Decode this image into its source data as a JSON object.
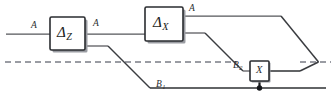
{
  "figure": {
    "type": "quantum-circuit-diagram",
    "width": 333,
    "height": 106,
    "background": "#ffffff",
    "wire_color": "#55565a",
    "dark_wire_color": "#2e3033",
    "dashed_color": "#7a7c85",
    "gate_stroke": "#2a2c30",
    "control_color": "#15171a"
  },
  "gates": [
    {
      "id": "delta-z",
      "symbol": "Δ",
      "subscript": "Z",
      "x": 50,
      "y": 17,
      "w": 35,
      "h": 33
    },
    {
      "id": "delta-x",
      "symbol": "Δ",
      "subscript": "X",
      "x": 145,
      "y": 7,
      "w": 38,
      "h": 34
    },
    {
      "id": "x-gate",
      "symbol": "X",
      "subscript": "",
      "x": 250,
      "y": 61,
      "w": 19,
      "h": 20
    }
  ],
  "wire_labels": [
    {
      "id": "label-a-input",
      "text": "A",
      "sub": "",
      "x": 31,
      "y": 21
    },
    {
      "id": "label-a-mid",
      "text": "A",
      "sub": "",
      "x": 93,
      "y": 19
    },
    {
      "id": "label-a-top",
      "text": "A",
      "sub": "",
      "x": 189,
      "y": 5
    },
    {
      "id": "label-b1",
      "text": "B",
      "sub": "1",
      "x": 156,
      "y": 82
    },
    {
      "id": "label-b2",
      "text": "B",
      "sub": "2",
      "x": 234,
      "y": 63
    }
  ],
  "paths": {
    "input_a": "M 6 34 L 50 34",
    "a_mid": "M 85 34 L 145 34",
    "a_top_out": "M 183 16 L 281 16",
    "a_top_diag": "M 281 16 L 318 62",
    "z_lower_out": "M 85 46 L 108 46",
    "z_lower_diag": "M 108 46 L 150 88",
    "b1_bottom": "M 150 88 L 325 88",
    "x_lower_out": "M 183 33 L 205 33",
    "x_lower_diag": "M 205 33 L 243 71",
    "b2_into_x": "M 243 71 L 250 71",
    "x_out": "M 269 71 L 300 71",
    "x_out_diag": "M 300 71 L 318 62",
    "dashed_left": "M 5 62 L 237 62",
    "dashed_right": "M 300 62 L 330 62",
    "control_line": "M 259 81 L 259 88",
    "control_dot": {
      "cx": 259,
      "cy": 88,
      "r": 2.6
    }
  }
}
